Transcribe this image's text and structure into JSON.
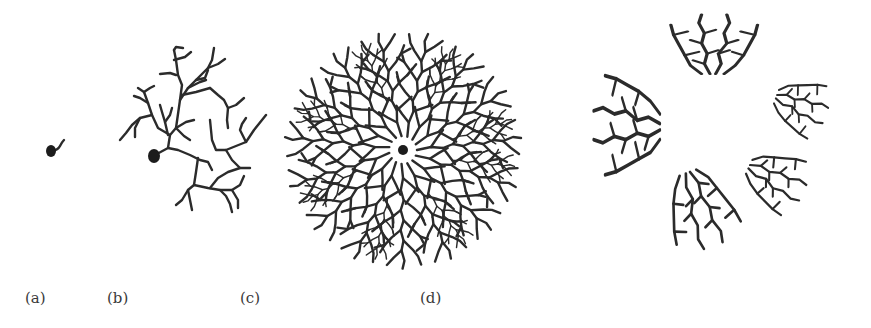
{
  "figure": {
    "panels": [
      {
        "id": "a",
        "label": "(a)",
        "description": "single cell body with short process"
      },
      {
        "id": "b",
        "label": "(b)",
        "description": "cell body with sparse branching dendritic tree"
      },
      {
        "id": "c",
        "label": "(c)",
        "description": "cell body with dense circular dendritic arbor"
      },
      {
        "id": "d",
        "label": "(d)",
        "description": "five separated fragments of dendritic arbor arranged in a ring"
      }
    ]
  },
  "colors": {
    "ink": "#2b2b2b",
    "background": "#ffffff"
  }
}
